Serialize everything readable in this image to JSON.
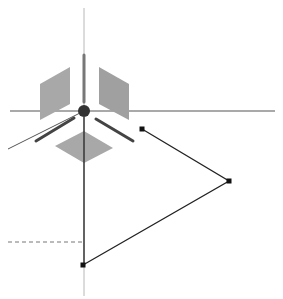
{
  "viewport": {
    "width": 283,
    "height": 299,
    "background": "#ffffff"
  },
  "colors": {
    "axis_light": "#b8b8b8",
    "axis_dark": "#555555",
    "plane_fill": "#a8a8a8",
    "plane_fill_right": "#a0a0a0",
    "handle_bar": "#444444",
    "center_sphere": "#333333",
    "path_stroke": "#222222",
    "control_point": "#111111",
    "dashed_guide": "#777777"
  },
  "gizmo": {
    "center": [
      84,
      111
    ],
    "axes": {
      "vertical": {
        "x": 84,
        "y_top": 8,
        "y_bottom": 296
      },
      "horizontal": {
        "y": 111,
        "x_left": 10,
        "x_right": 275
      },
      "diagonal": {
        "x1": 84,
        "y1": 111,
        "x2": 8,
        "y2": 149
      }
    },
    "handle_bars": [
      {
        "name": "y-axis-handle",
        "x1": 84,
        "y1": 55,
        "x2": 84,
        "y2": 102
      },
      {
        "name": "x-axis-handle-left",
        "x1": 74,
        "y1": 118,
        "x2": 36,
        "y2": 141
      },
      {
        "name": "z-axis-handle-right",
        "x1": 96,
        "y1": 119,
        "x2": 133,
        "y2": 141
      }
    ],
    "planes": [
      {
        "name": "plane-left",
        "points": "40,84 70,67 70,104 40,120"
      },
      {
        "name": "plane-right",
        "points": "99,67 129,84 129,120 99,104"
      },
      {
        "name": "plane-bottom",
        "points": "55,146 84,131 113,148 84,163"
      }
    ],
    "sphere_radius": 6
  },
  "path": {
    "points": [
      {
        "x": 142,
        "y": 129
      },
      {
        "x": 229,
        "y": 181
      },
      {
        "x": 83,
        "y": 265
      }
    ],
    "vertical_segment": {
      "x": 84,
      "y1": 117,
      "y2": 265
    }
  },
  "guide": {
    "dashed": {
      "x1": 8,
      "y1": 242,
      "x2": 83,
      "y2": 242
    }
  }
}
